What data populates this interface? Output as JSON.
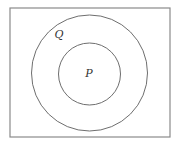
{
  "diagram": {
    "type": "venn-subset",
    "universe": {
      "label": "",
      "x": 10,
      "y": 8,
      "width": 160,
      "height": 129,
      "stroke": "#8a8a8a"
    },
    "sets": [
      {
        "id": "Q",
        "label": "Q",
        "cx": 89.5,
        "cy": 73,
        "r": 58,
        "label_x": 59,
        "label_y": 38,
        "stroke": "#6e6e6e"
      },
      {
        "id": "P",
        "label": "P",
        "cx": 89.5,
        "cy": 74,
        "r": 31,
        "label_x": 89,
        "label_y": 77,
        "stroke": "#6e6e6e"
      }
    ],
    "relationship": "P ⊂ Q"
  }
}
